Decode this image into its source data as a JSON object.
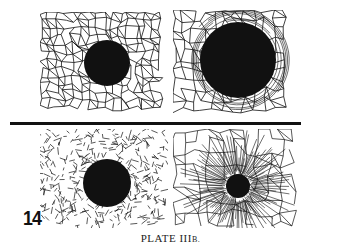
{
  "plate": {
    "page_number": "14",
    "caption_main": "PLATE III",
    "caption_suffix": "B."
  },
  "figures": [
    {
      "id": "top-left",
      "pattern": "cellular-network",
      "dot": "medium-black-disc"
    },
    {
      "id": "top-right",
      "pattern": "concentric-compressed-network",
      "dot": "large-black-disc"
    },
    {
      "id": "bottom-left",
      "pattern": "fragmented-network",
      "dot": "medium-black-disc"
    },
    {
      "id": "bottom-right",
      "pattern": "radial-network",
      "dot": "small-black-disc"
    }
  ],
  "colors": {
    "ink": "#111111",
    "paper": "#ffffff"
  }
}
